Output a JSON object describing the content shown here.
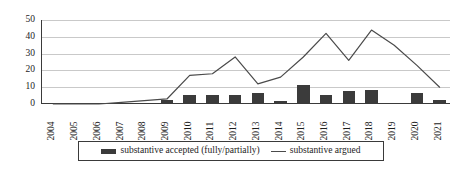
{
  "chart_data": {
    "type": "bar",
    "title": "",
    "xlabel": "",
    "ylabel": "",
    "ylim": [
      0,
      50
    ],
    "yticks": [
      0,
      10,
      20,
      30,
      40,
      50
    ],
    "grid": true,
    "legend_position": "bottom",
    "categories": [
      "2004",
      "2005",
      "2006",
      "2007",
      "2008",
      "2009",
      "2010",
      "2011",
      "2012",
      "2013",
      "2014",
      "2015",
      "2016",
      "2017",
      "2018",
      "2019",
      "2020",
      "2021"
    ],
    "series": [
      {
        "name": "substantive accepted (fully/partially)",
        "type": "bar",
        "color": "#3b3b3b",
        "values": [
          0,
          0,
          0,
          0,
          0,
          2,
          5,
          5,
          5,
          6,
          1,
          11,
          5,
          7,
          8,
          0,
          6,
          2
        ]
      },
      {
        "name": "substantive argued",
        "type": "line",
        "color": "#4a4a4a",
        "values": [
          0,
          0,
          0,
          1,
          2,
          3,
          17,
          18,
          28,
          12,
          16,
          28,
          42,
          26,
          44,
          35,
          23,
          10
        ]
      }
    ]
  },
  "legend": {
    "items": [
      {
        "label": "substantive accepted (fully/partially)",
        "marker": "bar-swatch"
      },
      {
        "label": "substantive argued",
        "marker": "line-swatch"
      }
    ]
  }
}
